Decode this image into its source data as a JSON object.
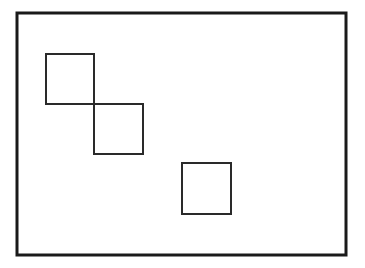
{
  "diagram": {
    "background_color": "#ffffff",
    "frame": {
      "x": 17,
      "y": 13,
      "width": 329,
      "height": 242,
      "stroke": "#1a1a1a",
      "stroke_width": 3
    },
    "squares": [
      {
        "id": "square-1",
        "x": 46,
        "y": 54,
        "width": 48,
        "height": 50,
        "stroke": "#2a2a2a",
        "stroke_width": 2
      },
      {
        "id": "square-2",
        "x": 94,
        "y": 104,
        "width": 49,
        "height": 50,
        "stroke": "#2a2a2a",
        "stroke_width": 2
      },
      {
        "id": "square-3",
        "x": 182,
        "y": 163,
        "width": 49,
        "height": 51,
        "stroke": "#2a2a2a",
        "stroke_width": 2
      }
    ]
  }
}
